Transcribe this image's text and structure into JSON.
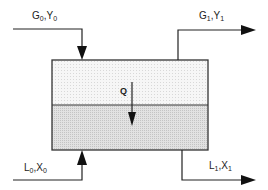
{
  "diagram": {
    "type": "two-phase contactor stage",
    "streams": [
      {
        "id": "gas-in",
        "label_main1": "G",
        "sub1": "0",
        "sep": ",",
        "label_main2": "Y",
        "sub2": "0"
      },
      {
        "id": "gas-out",
        "label_main1": "G",
        "sub1": "1",
        "sep": ",",
        "label_main2": "Y",
        "sub2": "1"
      },
      {
        "id": "liq-in",
        "label_main1": "L",
        "sub1": "0",
        "sep": ",",
        "label_main2": "X",
        "sub2": "0"
      },
      {
        "id": "liq-out",
        "label_main1": "L",
        "sub1": "1",
        "sep": ",",
        "label_main2": "X",
        "sub2": "1"
      }
    ],
    "transfer": {
      "label": "Q"
    },
    "colors": {
      "line": "#222222",
      "upper_phase": "#f4f4f4",
      "lower_phase": "#dcdcdc"
    }
  }
}
